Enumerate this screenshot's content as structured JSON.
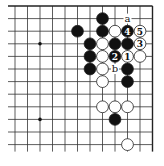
{
  "diagram": {
    "type": "go-board-corner",
    "region": "top-right",
    "grid": {
      "cols": 12,
      "rows": 12,
      "x0": 15,
      "y0": 6,
      "dx": 12.5,
      "dy": 12.6,
      "top_edge": true,
      "right_edge": true
    },
    "colors": {
      "line": "#333333",
      "edge": "#222222",
      "black_stone": "#111111",
      "white_stone": "#ffffff",
      "stone_outline": "#222222"
    },
    "star_points": [
      {
        "col": 2,
        "row": 3
      },
      {
        "col": 2,
        "row": 9
      }
    ],
    "stones": [
      {
        "color": "black",
        "col": 7,
        "row": 1,
        "label": ""
      },
      {
        "color": "black",
        "col": 5,
        "row": 2,
        "label": ""
      },
      {
        "color": "black",
        "col": 7,
        "row": 2,
        "label": ""
      },
      {
        "color": "white",
        "col": 8,
        "row": 2,
        "label": ""
      },
      {
        "color": "black",
        "col": 9,
        "row": 2,
        "label": "4"
      },
      {
        "color": "white",
        "col": 10,
        "row": 2,
        "label": "5"
      },
      {
        "color": "black",
        "col": 6,
        "row": 3,
        "label": ""
      },
      {
        "color": "white",
        "col": 7,
        "row": 3,
        "label": ""
      },
      {
        "color": "black",
        "col": 8,
        "row": 3,
        "label": ""
      },
      {
        "color": "black",
        "col": 9,
        "row": 3,
        "label": ""
      },
      {
        "color": "white",
        "col": 10,
        "row": 3,
        "label": "3"
      },
      {
        "color": "black",
        "col": 6,
        "row": 4,
        "label": ""
      },
      {
        "color": "white",
        "col": 7,
        "row": 4,
        "label": ""
      },
      {
        "color": "black",
        "col": 8,
        "row": 4,
        "label": "2"
      },
      {
        "color": "white",
        "col": 9,
        "row": 4,
        "label": "1"
      },
      {
        "color": "white",
        "col": 10,
        "row": 4,
        "label": ""
      },
      {
        "color": "black",
        "col": 6,
        "row": 5,
        "label": ""
      },
      {
        "color": "white",
        "col": 7,
        "row": 5,
        "label": ""
      },
      {
        "color": "black",
        "col": 9,
        "row": 5,
        "label": ""
      },
      {
        "color": "white",
        "col": 7,
        "row": 6,
        "label": ""
      },
      {
        "color": "black",
        "col": 9,
        "row": 6,
        "label": ""
      },
      {
        "color": "white",
        "col": 7,
        "row": 8,
        "label": ""
      },
      {
        "color": "white",
        "col": 8,
        "row": 8,
        "label": ""
      },
      {
        "color": "white",
        "col": 9,
        "row": 8,
        "label": ""
      },
      {
        "color": "black",
        "col": 8,
        "row": 9,
        "label": ""
      },
      {
        "color": "white",
        "col": 9,
        "row": 11,
        "label": ""
      }
    ],
    "point_labels": [
      {
        "text": "a",
        "col": 9,
        "row": 1
      },
      {
        "text": "b",
        "col": 8,
        "row": 5
      }
    ]
  }
}
